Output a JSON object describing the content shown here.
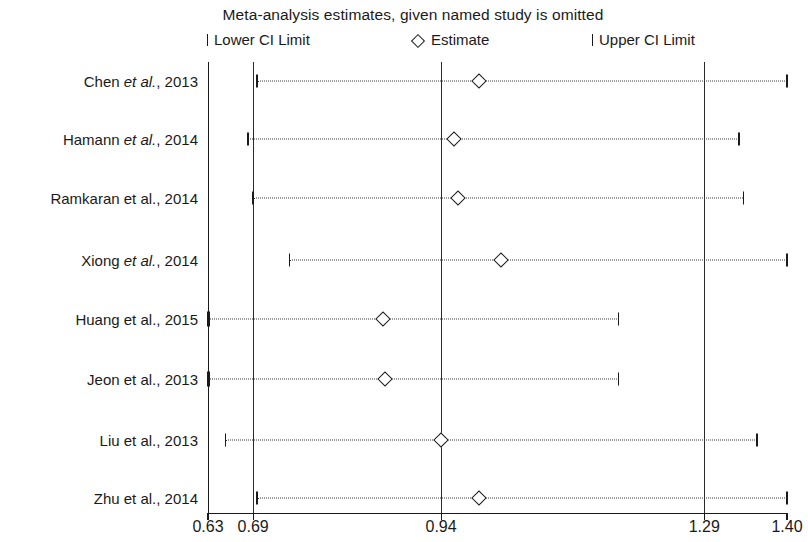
{
  "chart_data": {
    "type": "line",
    "title": "Meta-analysis estimates, given named study is omitted",
    "xlabel": "",
    "ylabel": "",
    "xlim": [
      0.63,
      1.4
    ],
    "grid": false,
    "legend_position": "top",
    "legend": [
      {
        "key": "lower",
        "marker": "|",
        "label": "Lower CI Limit"
      },
      {
        "key": "estimate",
        "marker": "◇",
        "label": "Estimate"
      },
      {
        "key": "upper",
        "marker": "|",
        "label": "Upper CI Limit"
      }
    ],
    "reference_lines": [
      {
        "value": 0.69,
        "label": "0.69"
      },
      {
        "value": 0.94,
        "label": "0.94"
      },
      {
        "value": 1.29,
        "label": "1.29"
      }
    ],
    "xticks": [
      {
        "value": 0.63,
        "label": "0.63"
      },
      {
        "value": 0.69,
        "label": "0.69"
      },
      {
        "value": 0.94,
        "label": "0.94"
      },
      {
        "value": 1.29,
        "label": "1.29"
      },
      {
        "value": 1.4,
        "label": "1.40"
      }
    ],
    "categories": [
      "Chen et al., 2013",
      "Hamann et al., 2014",
      "Ramkaran et al., 2014",
      "Xiong et al., 2014",
      "Huang et al., 2015",
      "Jeon et al., 2013",
      "Liu et al., 2013",
      "Zhu et al., 2014"
    ],
    "rows": [
      {
        "study_prefix": "Chen ",
        "study_italic": "et al.",
        "study_suffix": ", 2013",
        "lower": 0.695,
        "estimate": 0.991,
        "upper": 1.4
      },
      {
        "study_prefix": "Hamann ",
        "study_italic": "et al.",
        "study_suffix": ", 2014",
        "lower": 0.683,
        "estimate": 0.957,
        "upper": 1.336
      },
      {
        "study_prefix": "Ramkaran ",
        "study_italic": "",
        "study_suffix": "et al., 2014",
        "lower": 0.69,
        "estimate": 0.963,
        "upper": 1.342
      },
      {
        "study_prefix": "Xiong ",
        "study_italic": "et al.",
        "study_suffix": ", 2014",
        "lower": 0.738,
        "estimate": 1.02,
        "upper": 1.4
      },
      {
        "study_prefix": "Huang ",
        "study_italic": "",
        "study_suffix": "et al., 2015",
        "lower": 0.63,
        "estimate": 0.863,
        "upper": 1.176
      },
      {
        "study_prefix": "Jeon ",
        "study_italic": "",
        "study_suffix": "et al., 2013",
        "lower": 0.63,
        "estimate": 0.866,
        "upper": 1.176
      },
      {
        "study_prefix": "Liu ",
        "study_italic": "",
        "study_suffix": "et al., 2013",
        "lower": 0.653,
        "estimate": 0.94,
        "upper": 1.36
      },
      {
        "study_prefix": "Zhu ",
        "study_italic": "",
        "study_suffix": "et al., 2014",
        "lower": 0.695,
        "estimate": 0.991,
        "upper": 1.4
      }
    ]
  }
}
